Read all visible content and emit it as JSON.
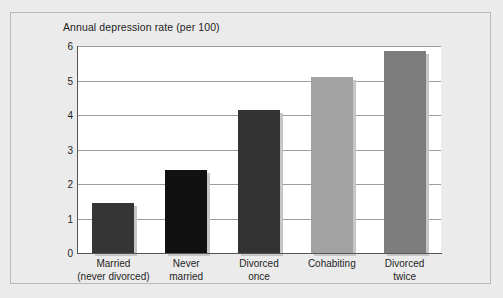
{
  "chart_data": {
    "type": "bar",
    "title": "Annual depression rate (per 100)",
    "xlabel": "",
    "ylabel": "",
    "ylim": [
      0,
      6
    ],
    "yticks": [
      "0",
      "1",
      "2",
      "3",
      "4",
      "5",
      "6"
    ],
    "grid": true,
    "legend": "none",
    "categories": [
      "Married\n(never divorced)",
      "Never\nmarried",
      "Divorced\nonce",
      "Cohabiting",
      "Divorced\ntwice"
    ],
    "category_lines": [
      [
        "Married",
        "(never divorced)"
      ],
      [
        "Never",
        "married"
      ],
      [
        "Divorced",
        "once"
      ],
      [
        "Cohabiting",
        ""
      ],
      [
        "Divorced",
        "twice"
      ]
    ],
    "values": [
      1.45,
      2.4,
      4.15,
      5.1,
      5.85
    ],
    "bar_colors": [
      "#353535",
      "#111111",
      "#333333",
      "#a3a3a3",
      "#7d7d7d"
    ],
    "shadow_color": "#c6c6c6"
  },
  "figure": {
    "background_color": "#ebebeb",
    "plot_background_color": "#ffffff",
    "border_color": "#b9b9b9",
    "axis_color": "#555555",
    "gridline_color": "#9c9c9c"
  }
}
